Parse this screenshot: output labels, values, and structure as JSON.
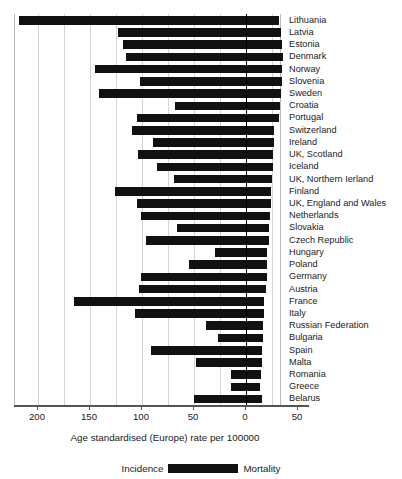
{
  "axis": {
    "title": "Age standardised (Europe) rate per 100000",
    "tick_labels": [
      "200",
      "150",
      "100",
      "50",
      "0",
      "50"
    ],
    "tick_values": [
      200,
      150,
      100,
      50,
      0,
      -50
    ],
    "left_label": "Incidence",
    "right_label": "Mortality",
    "bar_color": "#111111",
    "grid_color": "#d3d3d3",
    "zero_color": "#000000"
  },
  "legend": {
    "incidence_label": "Incidence",
    "mortality_label": "Mortality",
    "swatch_name": "bar-colour-swatch"
  },
  "chart_data": {
    "type": "bar",
    "orientation": "horizontal",
    "layout": "bidirectional-population-pyramid",
    "title": "",
    "subtitle": "",
    "xlabel": "Age standardised (Europe) rate per 100000",
    "ylabel": "",
    "xlim": [
      219,
      -58
    ],
    "xticks": [
      200,
      150,
      100,
      50,
      0,
      -50
    ],
    "xtick_labels": [
      "200",
      "150",
      "100",
      "50",
      "0",
      "50"
    ],
    "grid": true,
    "grid_interval": 25,
    "legend_position": "bottom-center",
    "legend_entries": [
      "Incidence",
      "Mortality"
    ],
    "categories": [
      "Lithuania",
      "Latvia",
      "Estonia",
      "Denmark",
      "Norway",
      "Slovenia",
      "Sweden",
      "Croatia",
      "Portugal",
      "Switzerland",
      "Ireland",
      "UK, Scotland",
      "Iceland",
      "UK, Northern Ierland",
      "Finland",
      "UK, England and Wales",
      "Netherlands",
      "Slovakia",
      "Czech Republic",
      "Hungary",
      "Poland",
      "Germany",
      "Austria",
      "France",
      "Italy",
      "Russian Federation",
      "Bulgaria",
      "Spain",
      "Malta",
      "Romania",
      "Greece",
      "Belarus"
    ],
    "series": [
      {
        "name": "Incidence",
        "direction": "left",
        "values": [
          218,
          123,
          118,
          115,
          145,
          102,
          141,
          68,
          105,
          110,
          89,
          104,
          86,
          69,
          126,
          105,
          101,
          66,
          96,
          30,
          55,
          101,
          103,
          165,
          107,
          38,
          27,
          91,
          48,
          14,
          14,
          50
        ]
      },
      {
        "name": "Mortality",
        "direction": "right",
        "values": [
          32,
          34,
          35,
          36,
          35,
          35,
          34,
          33,
          32,
          27,
          27,
          26,
          26,
          25,
          24,
          24,
          23,
          22,
          22,
          20,
          20,
          20,
          19,
          17,
          17,
          16,
          16,
          15,
          15,
          14,
          13,
          15
        ]
      }
    ]
  }
}
